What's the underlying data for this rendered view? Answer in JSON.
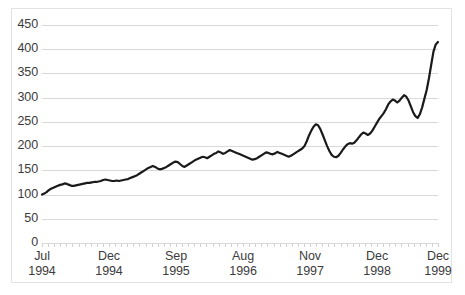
{
  "chart_data": {
    "type": "line",
    "title": "",
    "xlabel": "",
    "ylabel": "",
    "ylim": [
      0,
      450
    ],
    "ytick_step": 50,
    "grid": true,
    "legend": false,
    "legend_position": "none",
    "line_color": "#1a1a1a",
    "grid_color": "#d9d9d9",
    "axis_text_color": "#3c3c3c",
    "yticks": [
      "0",
      "50",
      "100",
      "150",
      "200",
      "250",
      "300",
      "350",
      "400",
      "450"
    ],
    "xticks": [
      {
        "month": "Jul",
        "year": "1994",
        "index": 0
      },
      {
        "month": "Dec",
        "year": "1994",
        "index": 11
      },
      {
        "month": "Sep",
        "year": "1995",
        "index": 22
      },
      {
        "month": "Aug",
        "year": "1996",
        "index": 33
      },
      {
        "month": "Nov",
        "year": "1997",
        "index": 44
      },
      {
        "month": "Dec",
        "year": "1998",
        "index": 55
      },
      {
        "month": "Dec",
        "year": "1999",
        "index": 65
      }
    ],
    "x": [
      "Jul 1994",
      "Aug 1994",
      "Sep 1994",
      "Oct 1994",
      "Nov 1994",
      "Dec 1994",
      "Jan 1995",
      "Feb 1995",
      "Mar 1995",
      "Apr 1995",
      "May 1995",
      "Jun 1995",
      "Jul 1995",
      "Aug 1995",
      "Sep 1995",
      "Oct 1995",
      "Nov 1995",
      "Dec 1995",
      "Jan 1996",
      "Feb 1996",
      "Mar 1996",
      "Apr 1996",
      "May 1996",
      "Jun 1996",
      "Jul 1996",
      "Aug 1996",
      "Sep 1996",
      "Oct 1996",
      "Nov 1996",
      "Dec 1996",
      "Jan 1997",
      "Feb 1997",
      "Mar 1997",
      "Apr 1997",
      "May 1997",
      "Jun 1997",
      "Jul 1997",
      "Aug 1997",
      "Sep 1997",
      "Oct 1997",
      "Nov 1997",
      "Dec 1997",
      "Jan 1998",
      "Feb 1998",
      "Mar 1998",
      "Apr 1998",
      "May 1998",
      "Jun 1998",
      "Jul 1998",
      "Aug 1998",
      "Sep 1998",
      "Oct 1998",
      "Nov 1998",
      "Dec 1998",
      "Jan 1999",
      "Feb 1999",
      "Mar 1999",
      "Apr 1999",
      "May 1999",
      "Jun 1999",
      "Jul 1999",
      "Aug 1999",
      "Sep 1999",
      "Oct 1999",
      "Nov 1999",
      "Dec 1999"
    ],
    "values": [
      100,
      104,
      110,
      113,
      117,
      119,
      123,
      121,
      118,
      119,
      120,
      122,
      123,
      124,
      124,
      126,
      126,
      131,
      130,
      128,
      128,
      130,
      128,
      131,
      132,
      134,
      136,
      139,
      141,
      146,
      148,
      152,
      155,
      159,
      157,
      152,
      151,
      156,
      158,
      162,
      167,
      168,
      163,
      158,
      163,
      167,
      172,
      176,
      174,
      170,
      178,
      181,
      185,
      183,
      187,
      190,
      187,
      183,
      185,
      180,
      183,
      188,
      191,
      186,
      179,
      184
    ],
    "values_detail": [
      100,
      102,
      105,
      109,
      112,
      114,
      116,
      118,
      120,
      121,
      123,
      122,
      120,
      118,
      118,
      119,
      120,
      121,
      122,
      123,
      124,
      124,
      125,
      126,
      126,
      127,
      128,
      130,
      131,
      130,
      129,
      128,
      128,
      129,
      128,
      129,
      130,
      131,
      132,
      134,
      136,
      138,
      140,
      143,
      146,
      149,
      152,
      155,
      157,
      159,
      157,
      154,
      152,
      153,
      155,
      157,
      160,
      163,
      166,
      168,
      167,
      163,
      159,
      157,
      160,
      163,
      166,
      169,
      172,
      174,
      176,
      178,
      177,
      175,
      178,
      181,
      184,
      186,
      189,
      187,
      184,
      186,
      189,
      192,
      190,
      188,
      186,
      184,
      182,
      180,
      178,
      176,
      174,
      172,
      173,
      175,
      178,
      181,
      184,
      187,
      186,
      184,
      183,
      185,
      188,
      186,
      184,
      182,
      180,
      178,
      180,
      183,
      186,
      189,
      192,
      195,
      200,
      210,
      222,
      232,
      240,
      245,
      243,
      235,
      224,
      212,
      200,
      190,
      182,
      178,
      177,
      180,
      186,
      193,
      199,
      204,
      206,
      205,
      207,
      212,
      218,
      224,
      228,
      226,
      223,
      226,
      232,
      240,
      248,
      256,
      262,
      268,
      276,
      286,
      292,
      296,
      294,
      290,
      294,
      300,
      305,
      302,
      294,
      282,
      270,
      262,
      258,
      266,
      280,
      298,
      316,
      340,
      368,
      395,
      410,
      415
    ],
    "annotations": {
      "start_value": 100,
      "end_value": 415,
      "peak_1997_value": 245,
      "trough_1998_value": 177,
      "peak_1999_value": 305,
      "trough_late_1999_value": 258
    },
    "series_name": "index"
  }
}
